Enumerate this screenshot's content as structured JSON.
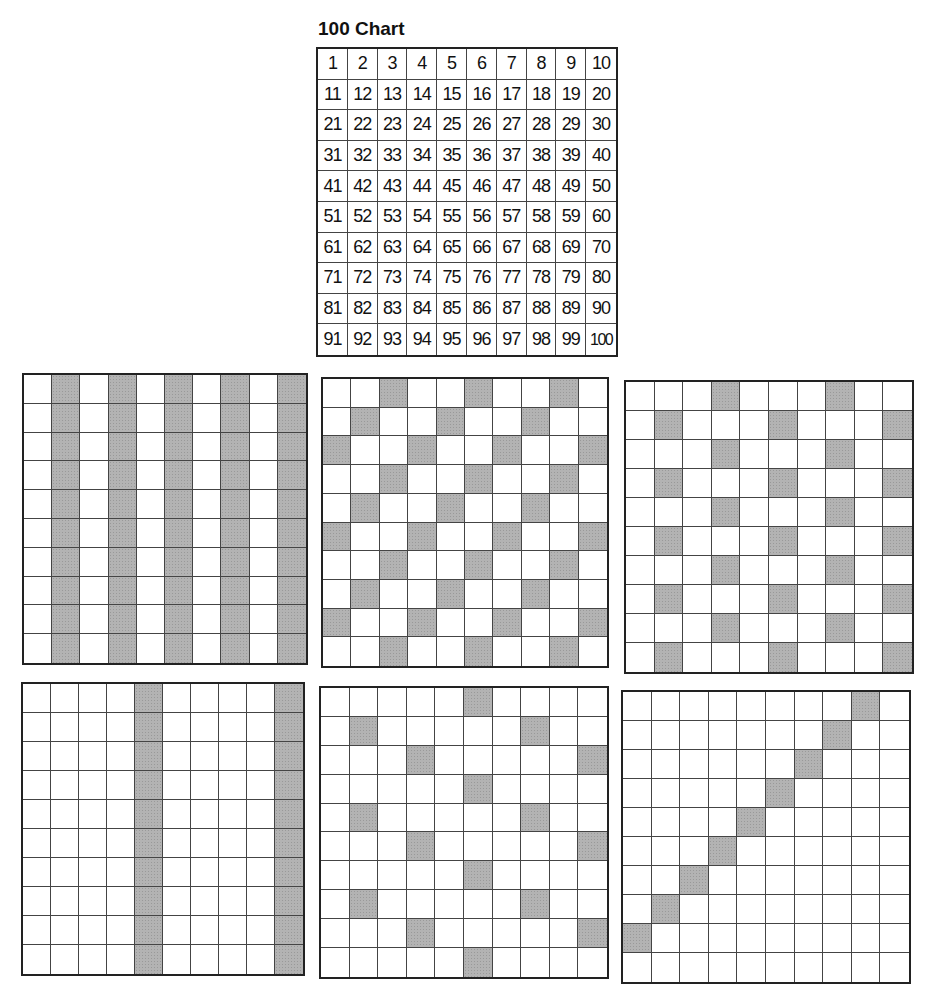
{
  "title": "100 Chart",
  "hundred_chart": {
    "rows": 10,
    "cols": 10,
    "numbers": [
      1,
      2,
      3,
      4,
      5,
      6,
      7,
      8,
      9,
      10,
      11,
      12,
      13,
      14,
      15,
      16,
      17,
      18,
      19,
      20,
      21,
      22,
      23,
      24,
      25,
      26,
      27,
      28,
      29,
      30,
      31,
      32,
      33,
      34,
      35,
      36,
      37,
      38,
      39,
      40,
      41,
      42,
      43,
      44,
      45,
      46,
      47,
      48,
      49,
      50,
      51,
      52,
      53,
      54,
      55,
      56,
      57,
      58,
      59,
      60,
      61,
      62,
      63,
      64,
      65,
      66,
      67,
      68,
      69,
      70,
      71,
      72,
      73,
      74,
      75,
      76,
      77,
      78,
      79,
      80,
      81,
      82,
      83,
      84,
      85,
      86,
      87,
      88,
      89,
      90,
      91,
      92,
      93,
      94,
      95,
      96,
      97,
      98,
      99,
      100
    ]
  },
  "colors": {
    "grid_line": "#444444",
    "border": "#222222",
    "shade": "#b3b3b3",
    "background": "#ffffff"
  },
  "shaded_grids": [
    {
      "id": "g1",
      "pattern": "multiples-of-2",
      "shaded": [
        2,
        4,
        6,
        8,
        10,
        12,
        14,
        16,
        18,
        20,
        22,
        24,
        26,
        28,
        30,
        32,
        34,
        36,
        38,
        40,
        42,
        44,
        46,
        48,
        50,
        52,
        54,
        56,
        58,
        60,
        62,
        64,
        66,
        68,
        70,
        72,
        74,
        76,
        78,
        80,
        82,
        84,
        86,
        88,
        90,
        92,
        94,
        96,
        98,
        100
      ]
    },
    {
      "id": "g2",
      "pattern": "multiples-of-3",
      "shaded": [
        3,
        6,
        9,
        12,
        15,
        18,
        21,
        24,
        27,
        30,
        33,
        36,
        39,
        42,
        45,
        48,
        51,
        54,
        57,
        60,
        63,
        66,
        69,
        72,
        75,
        78,
        81,
        84,
        87,
        90,
        93,
        96,
        99
      ]
    },
    {
      "id": "g3",
      "pattern": "multiples-of-4",
      "shaded": [
        4,
        8,
        12,
        16,
        20,
        24,
        28,
        32,
        36,
        40,
        44,
        48,
        52,
        56,
        60,
        64,
        68,
        72,
        76,
        80,
        84,
        88,
        92,
        96,
        100
      ]
    },
    {
      "id": "g4",
      "pattern": "multiples-of-5",
      "shaded": [
        5,
        10,
        15,
        20,
        25,
        30,
        35,
        40,
        45,
        50,
        55,
        60,
        65,
        70,
        75,
        80,
        85,
        90,
        95,
        100
      ]
    },
    {
      "id": "g5",
      "pattern": "multiples-of-6",
      "shaded": [
        6,
        12,
        18,
        24,
        30,
        36,
        42,
        48,
        54,
        60,
        66,
        72,
        78,
        84,
        90,
        96
      ]
    },
    {
      "id": "g6",
      "pattern": "multiples-of-9-diagonal",
      "shaded": [
        9,
        18,
        27,
        36,
        45,
        54,
        63,
        72,
        81
      ]
    }
  ]
}
